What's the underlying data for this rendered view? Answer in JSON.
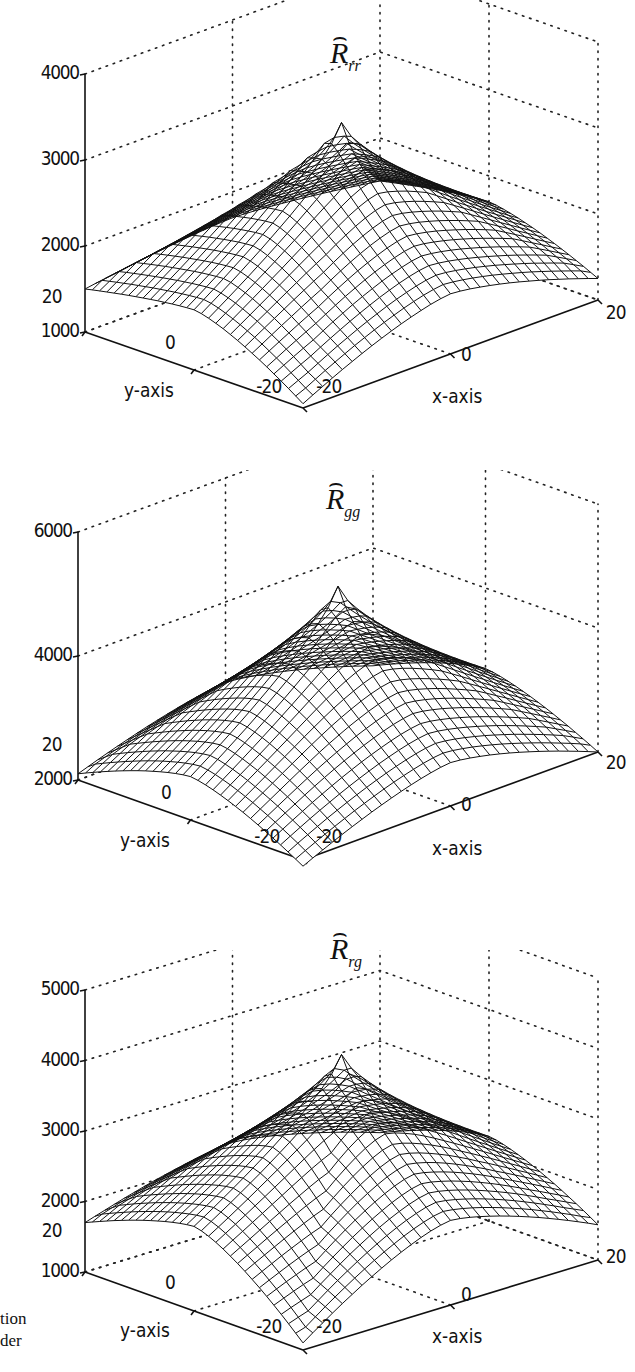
{
  "figure": {
    "caption_fragment": [
      "tion",
      "der"
    ]
  },
  "chart_data": [
    {
      "type": "surface3d",
      "title": "R̂_rr",
      "title_base": "R",
      "title_sub": "rr",
      "xlabel": "x-axis",
      "ylabel": "y-axis",
      "zlabel": "",
      "xlim": [
        -20,
        20
      ],
      "ylim": [
        -20,
        20
      ],
      "zlim": [
        1000,
        4000
      ],
      "xticks": [
        "-20",
        "0",
        "20"
      ],
      "yticks": [
        "-20",
        "0",
        "20"
      ],
      "zticks": [
        "1000",
        "2000",
        "3000",
        "4000"
      ],
      "grid": true,
      "surface": {
        "shape": "pyramid-like peak at origin, concave sides",
        "peak": {
          "x": 0,
          "y": 0,
          "z": 3250
        },
        "corner_values": {
          "(-20,20)": 1500,
          "(20,-20)": 1250,
          "(-20,-20)": 1050,
          "(20,20)": 1500
        },
        "edge_mid_values": 1700,
        "mesh_resolution": 30
      }
    },
    {
      "type": "surface3d",
      "title": "R̂_gg",
      "title_base": "R",
      "title_sub": "gg",
      "xlabel": "x-axis",
      "ylabel": "y-axis",
      "zlabel": "",
      "xlim": [
        -20,
        20
      ],
      "ylim": [
        -20,
        20
      ],
      "zlim": [
        2000,
        6000
      ],
      "xticks": [
        "-20",
        "0",
        "20"
      ],
      "yticks": [
        "-20",
        "0",
        "20"
      ],
      "zticks": [
        "2000",
        "4000",
        "6000"
      ],
      "grid": true,
      "surface": {
        "shape": "pyramid-like peak at origin, concave sides",
        "peak": {
          "x": 0,
          "y": 0,
          "z": 4900
        },
        "corner_values": {
          "(-20,20)": 2100,
          "(20,-20)": 2000,
          "(-20,-20)": 1900,
          "(20,20)": 2100
        },
        "edge_mid_values": 2700,
        "mesh_resolution": 30
      }
    },
    {
      "type": "surface3d",
      "title": "R̂_rg",
      "title_base": "R",
      "title_sub": "rg",
      "xlabel": "x-axis",
      "ylabel": "y-axis",
      "zlabel": "",
      "xlim": [
        -20,
        20
      ],
      "ylim": [
        -20,
        20
      ],
      "zlim": [
        1000,
        5000
      ],
      "xticks": [
        "-20",
        "0",
        "20"
      ],
      "yticks": [
        "-20",
        "0",
        "20"
      ],
      "zticks": [
        "1000",
        "2000",
        "3000",
        "4000",
        "5000"
      ],
      "grid": true,
      "surface": {
        "shape": "pyramid-like peak at origin, concave sides",
        "peak": {
          "x": 0,
          "y": 0,
          "z": 4000
        },
        "corner_values": {
          "(-20,20)": 1700,
          "(20,-20)": 1500,
          "(-20,-20)": 1100,
          "(20,20)": 1700
        },
        "edge_mid_values": 2200,
        "mesh_resolution": 30
      }
    }
  ]
}
